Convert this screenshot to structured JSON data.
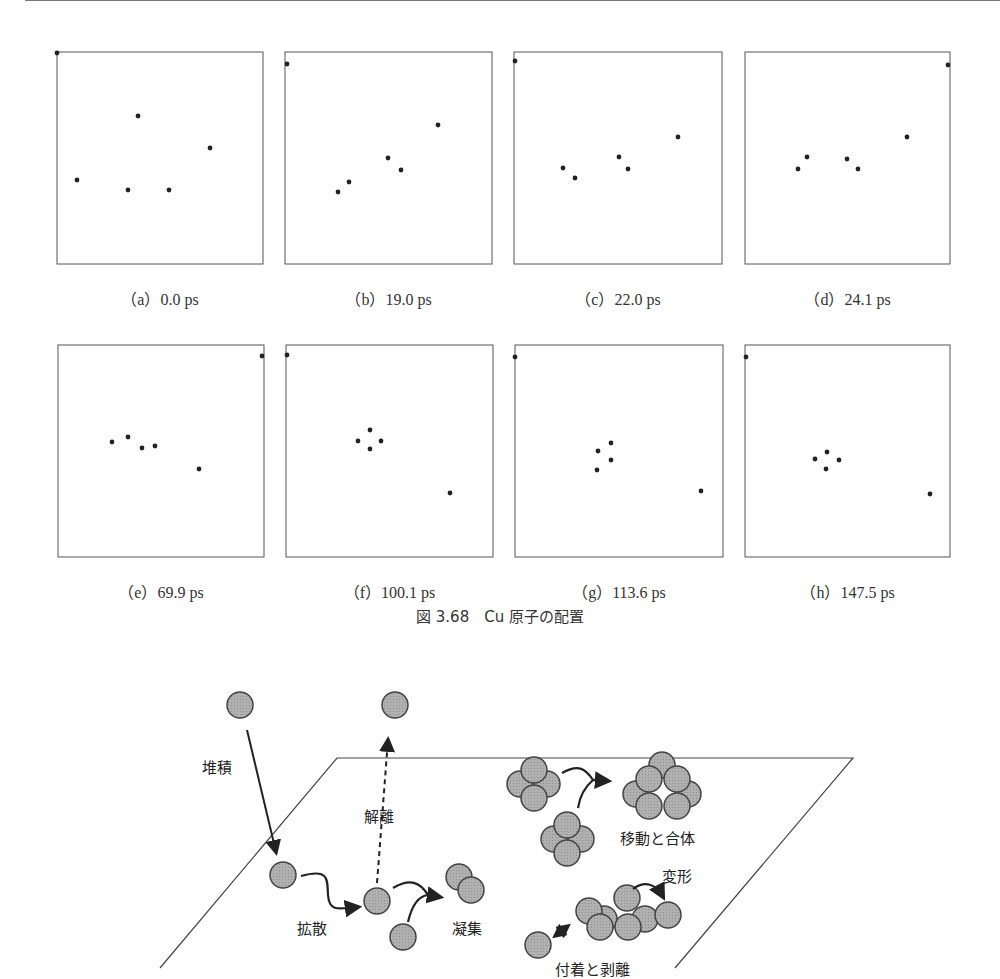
{
  "figure1": {
    "caption": "図 3.68　Cu 原子の配置",
    "panels": [
      {
        "id": "a",
        "label": "（a）0.0 ps",
        "time_ps": 0.0,
        "box": [
          57,
          52,
          263,
          264
        ],
        "atoms": [
          [
            57,
            53
          ],
          [
            138,
            116
          ],
          [
            77,
            180
          ],
          [
            128,
            190
          ],
          [
            169,
            190
          ],
          [
            210,
            148
          ]
        ]
      },
      {
        "id": "b",
        "label": "（b）19.0 ps",
        "time_ps": 19.0,
        "box": [
          285,
          52,
          492,
          264
        ],
        "atoms": [
          [
            287,
            64
          ],
          [
            438,
            125
          ],
          [
            388,
            158
          ],
          [
            401,
            170
          ],
          [
            349,
            182
          ],
          [
            338,
            192
          ]
        ]
      },
      {
        "id": "c",
        "label": "（c）22.0 ps",
        "time_ps": 22.0,
        "box": [
          514,
          52,
          722,
          264
        ],
        "atoms": [
          [
            515,
            61
          ],
          [
            678,
            137
          ],
          [
            619,
            157
          ],
          [
            628,
            169
          ],
          [
            563,
            168
          ],
          [
            575,
            178
          ]
        ]
      },
      {
        "id": "d",
        "label": "（d）24.1 ps",
        "time_ps": 24.1,
        "box": [
          745,
          52,
          950,
          264
        ],
        "atoms": [
          [
            948,
            65
          ],
          [
            907,
            137
          ],
          [
            807,
            157
          ],
          [
            798,
            169
          ],
          [
            847,
            159
          ],
          [
            858,
            169
          ]
        ]
      },
      {
        "id": "e",
        "label": "（e）69.9 ps",
        "time_ps": 69.9,
        "box": [
          58,
          345,
          264,
          557
        ],
        "atoms": [
          [
            262,
            356
          ],
          [
            112,
            442
          ],
          [
            128,
            437
          ],
          [
            142,
            448
          ],
          [
            155,
            446
          ],
          [
            199,
            469
          ]
        ]
      },
      {
        "id": "f",
        "label": "（f）100.1 ps",
        "time_ps": 100.1,
        "box": [
          286,
          345,
          493,
          557
        ],
        "atoms": [
          [
            287,
            355
          ],
          [
            370,
            430
          ],
          [
            358,
            441
          ],
          [
            381,
            441
          ],
          [
            370,
            449
          ],
          [
            450,
            493
          ]
        ]
      },
      {
        "id": "g",
        "label": "（g）113.6 ps",
        "time_ps": 113.6,
        "box": [
          515,
          345,
          723,
          557
        ],
        "atoms": [
          [
            515,
            357
          ],
          [
            611,
            443
          ],
          [
            598,
            451
          ],
          [
            611,
            460
          ],
          [
            597,
            470
          ],
          [
            701,
            491
          ]
        ]
      },
      {
        "id": "h",
        "label": "（h）147.5 ps",
        "time_ps": 147.5,
        "box": [
          745,
          345,
          950,
          557
        ],
        "atoms": [
          [
            746,
            357
          ],
          [
            827,
            452
          ],
          [
            815,
            459
          ],
          [
            839,
            460
          ],
          [
            826,
            469
          ],
          [
            930,
            494
          ]
        ]
      }
    ]
  },
  "figure2": {
    "labels": {
      "deposition": "堆積",
      "desorption": "解離",
      "diffusion": "拡散",
      "aggregation": "凝集",
      "migration_coalescence": "移動と合体",
      "deformation": "変形",
      "attachment_detachment": "付着と剥離"
    },
    "colors": {
      "atom_fill": "#a8a8a8",
      "atom_stroke": "#444444",
      "line": "#222222"
    }
  }
}
